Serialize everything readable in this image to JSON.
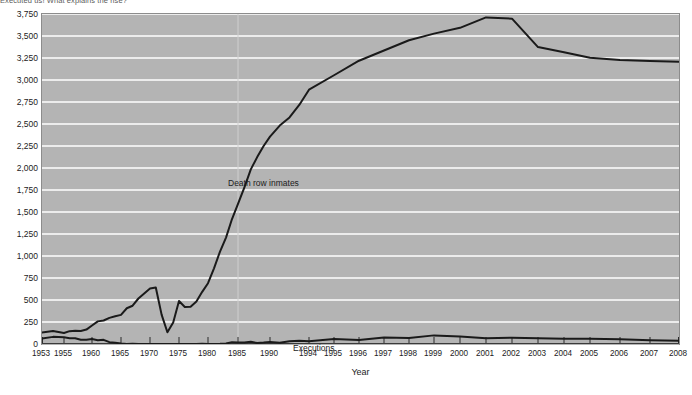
{
  "caption": "Executed us! What explains the rise?",
  "chart_data": {
    "type": "line",
    "title": "",
    "xlabel": "Year",
    "ylabel": "",
    "xlim": [
      1953,
      2008
    ],
    "ylim": [
      0,
      3750
    ],
    "grid": "horizontal-white-plus-vertical-1985",
    "legend": "in-plot annotations",
    "y_ticks": [
      "0",
      "250",
      "500",
      "750",
      "1,000",
      "1,250",
      "1,500",
      "1,750",
      "2,000",
      "2,250",
      "2,500",
      "2,750",
      "3,000",
      "3,250",
      "3,500",
      "3,750"
    ],
    "y_tick_values": [
      0,
      250,
      500,
      750,
      1000,
      1250,
      1500,
      1750,
      2000,
      2250,
      2500,
      2750,
      3000,
      3250,
      3500,
      3750
    ],
    "x_ticks": [
      "1953",
      "1955",
      "1960",
      "1965",
      "1970",
      "1975",
      "1980",
      "1985",
      "1990",
      "1994",
      "1995",
      "1996",
      "1997",
      "1998",
      "1999",
      "2000",
      "2001",
      "2002",
      "2003",
      "2004",
      "2005",
      "2006",
      "2007",
      "2008"
    ],
    "x_tick_values": [
      1953,
      1955,
      1960,
      1965,
      1970,
      1975,
      1980,
      1985,
      1990,
      1994,
      1995,
      1996,
      1997,
      1998,
      1999,
      2000,
      2001,
      2002,
      2003,
      2004,
      2005,
      2006,
      2007,
      2008
    ],
    "annotations": [
      {
        "text": "Death row inmates",
        "series": "Death row inmates"
      },
      {
        "text": "Executions",
        "series": "Executions"
      }
    ],
    "x": [
      1953,
      1954,
      1955,
      1956,
      1957,
      1958,
      1959,
      1960,
      1961,
      1962,
      1963,
      1964,
      1965,
      1966,
      1967,
      1968,
      1969,
      1970,
      1971,
      1972,
      1973,
      1974,
      1975,
      1976,
      1977,
      1978,
      1979,
      1980,
      1981,
      1982,
      1983,
      1984,
      1985,
      1986,
      1987,
      1988,
      1989,
      1990,
      1991,
      1992,
      1993,
      1994,
      1995,
      1996,
      1997,
      1998,
      1999,
      2000,
      2001,
      2002,
      2003,
      2004,
      2005,
      2006,
      2007,
      2008
    ],
    "series": [
      {
        "name": "Death row inmates",
        "values": [
          130,
          147,
          125,
          146,
          151,
          147,
          164,
          210,
          257,
          267,
          297,
          315,
          331,
          406,
          435,
          517,
          575,
          631,
          642,
          334,
          134,
          244,
          488,
          420,
          423,
          482,
          593,
          691,
          860,
          1050,
          1209,
          1420,
          1591,
          1781,
          1984,
          2124,
          2250,
          2356,
          2482,
          2575,
          2716,
          2890,
          3054,
          3219,
          3335,
          3452,
          3527,
          3593,
          3711,
          3697,
          3374,
          3315,
          3254,
          3228,
          3215,
          3207
        ],
        "peak": 3711,
        "peak_year": 2001,
        "end_value": 3207,
        "min_value": 134,
        "min_year": 1973,
        "color": "#1a1a1a"
      },
      {
        "name": "Executions",
        "values": [
          62,
          81,
          76,
          65,
          65,
          49,
          49,
          56,
          42,
          47,
          21,
          15,
          7,
          1,
          2,
          0,
          0,
          0,
          0,
          0,
          0,
          0,
          0,
          0,
          1,
          0,
          2,
          0,
          1,
          2,
          5,
          21,
          18,
          18,
          25,
          11,
          16,
          23,
          14,
          31,
          38,
          31,
          56,
          45,
          74,
          68,
          98,
          85,
          66,
          71,
          65,
          59,
          60,
          53,
          42,
          37
        ],
        "peak": 98,
        "peak_year": 1999,
        "end_value": 37,
        "color": "#1a1a1a"
      }
    ]
  },
  "axes": {
    "x_title": "Year"
  },
  "colors": {
    "plot_background": "#b4b4b4",
    "gridline": "#ffffff",
    "line": "#1a1a1a",
    "text": "#1c1c1c",
    "page_background": "#ffffff"
  }
}
